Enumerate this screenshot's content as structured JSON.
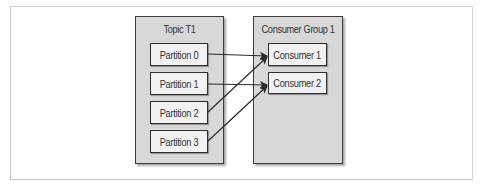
{
  "diagram": {
    "topic": {
      "title": "Topic T1",
      "partitions": [
        {
          "label": "Partition 0"
        },
        {
          "label": "Partition 1"
        },
        {
          "label": "Partition 2"
        },
        {
          "label": "Partition 3"
        }
      ]
    },
    "consumer_group": {
      "title": "Consumer Group 1",
      "consumers": [
        {
          "label": "Consumer 1"
        },
        {
          "label": "Consumer 2"
        }
      ]
    },
    "edges": [
      {
        "from": "Partition 0",
        "to": "Consumer 1"
      },
      {
        "from": "Partition 1",
        "to": "Consumer 2"
      },
      {
        "from": "Partition 2",
        "to": "Consumer 1"
      },
      {
        "from": "Partition 3",
        "to": "Consumer 2"
      }
    ],
    "colors": {
      "container_fill": "#d8d8d8",
      "node_fill": "#f1f1f1",
      "stroke": "#2e2e2e",
      "text": "#333333"
    }
  }
}
